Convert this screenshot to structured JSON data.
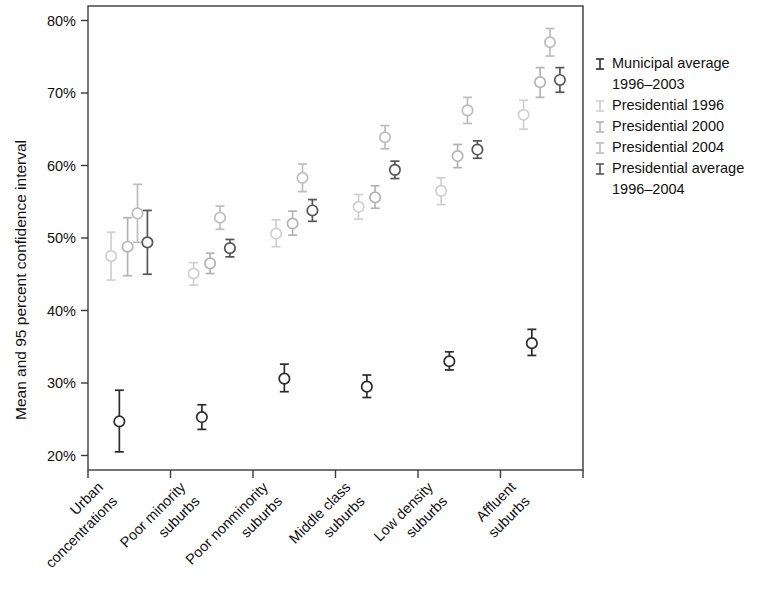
{
  "chart_data": {
    "type": "scatter",
    "title": "",
    "xlabel": "",
    "ylabel": "Mean and 95 percent confidence interval",
    "ylim": [
      18,
      82
    ],
    "ytick_values": [
      20,
      30,
      40,
      50,
      60,
      70,
      80
    ],
    "ytick_labels": [
      "20%",
      "30%",
      "40%",
      "50%",
      "60%",
      "70%",
      "80%"
    ],
    "grid": false,
    "legend_position": "right",
    "categories": [
      "Urban concentrations",
      "Poor minority suburbs",
      "Poor nonminority suburbs",
      "Middle class suburbs",
      "Low density suburbs",
      "Affluent suburbs"
    ],
    "category_lines": [
      [
        "Urban",
        "concentrations"
      ],
      [
        "Poor minority",
        "suburbs"
      ],
      [
        "Poor nonminority",
        "suburbs"
      ],
      [
        "Middle class",
        "suburbs"
      ],
      [
        "Low density",
        "suburbs"
      ],
      [
        "Affluent",
        "suburbs"
      ]
    ],
    "series": [
      {
        "name": "Municipal average 1996–2003",
        "color": "#2b2b2b",
        "offset": -0.12,
        "values": [
          24.7,
          25.3,
          30.6,
          29.5,
          33.0,
          35.5
        ],
        "ci_low": [
          20.5,
          23.6,
          28.8,
          28.0,
          31.8,
          33.8
        ],
        "ci_high": [
          29.0,
          27.0,
          32.6,
          31.1,
          34.3,
          37.4
        ]
      },
      {
        "name": "Presidential 1996",
        "color": "#d0d0d0",
        "offset": -0.22,
        "values": [
          47.5,
          45.1,
          50.6,
          54.3,
          56.5,
          67.0
        ],
        "ci_low": [
          44.2,
          43.5,
          48.8,
          52.6,
          54.6,
          65.0
        ],
        "ci_high": [
          50.8,
          46.6,
          52.5,
          56.0,
          58.3,
          69.0
        ]
      },
      {
        "name": "Presidential 2000",
        "color": "#b4b4b4",
        "offset": -0.02,
        "values": [
          48.8,
          46.5,
          52.0,
          55.6,
          61.3,
          71.5
        ],
        "ci_low": [
          44.8,
          45.1,
          50.4,
          54.1,
          59.7,
          69.4
        ],
        "ci_high": [
          52.8,
          47.9,
          53.7,
          57.2,
          62.9,
          73.5
        ]
      },
      {
        "name": "Presidential 2004",
        "color": "#bdbdbd",
        "offset": 0.1,
        "values": [
          53.4,
          52.8,
          58.3,
          63.9,
          67.6,
          77.0
        ],
        "ci_low": [
          49.4,
          51.2,
          56.4,
          62.3,
          65.8,
          75.1
        ],
        "ci_high": [
          57.4,
          54.4,
          60.2,
          65.5,
          69.4,
          78.9
        ]
      },
      {
        "name": "Presidential average 1996–2004",
        "color": "#555555",
        "offset": 0.22,
        "values": [
          49.4,
          48.6,
          53.8,
          59.4,
          62.2,
          71.8
        ],
        "ci_low": [
          45.0,
          47.4,
          52.3,
          58.2,
          61.0,
          70.1
        ],
        "ci_high": [
          53.8,
          49.8,
          55.3,
          60.6,
          63.4,
          73.5
        ]
      }
    ]
  },
  "axis": {
    "y_title": "Mean and 95 percent confidence interval"
  },
  "legend": {
    "entries": [
      {
        "label_line1": "Municipal average",
        "label_line2": "1996–2003",
        "color": "#2b2b2b"
      },
      {
        "label_line1": "Presidential 1996",
        "label_line2": "",
        "color": "#d0d0d0"
      },
      {
        "label_line1": "Presidential 2000",
        "label_line2": "",
        "color": "#b4b4b4"
      },
      {
        "label_line1": "Presidential 2004",
        "label_line2": "",
        "color": "#bdbdbd"
      },
      {
        "label_line1": "Presidential average",
        "label_line2": "1996–2004",
        "color": "#555555"
      }
    ]
  }
}
